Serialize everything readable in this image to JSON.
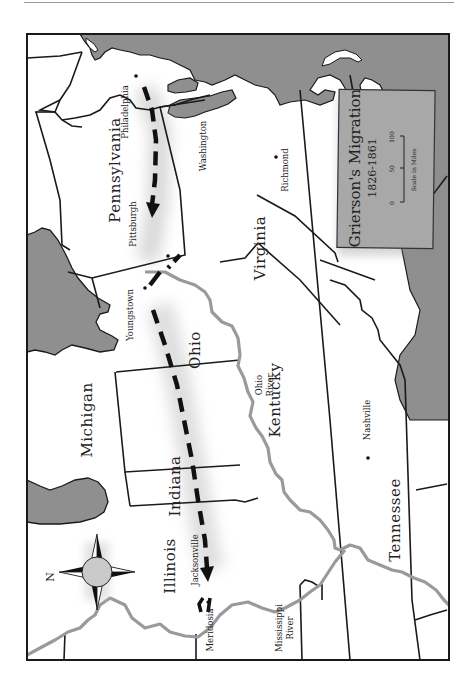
{
  "map": {
    "title": "Grierson's Migration",
    "subtitle": "1826-1861",
    "orientation": "rotated 90 degrees, north points left",
    "compass": {
      "label": "N",
      "icon": "compass-rose-icon"
    },
    "scale": {
      "ticks": [
        "0",
        "50",
        "100"
      ],
      "label": "Scale in Miles"
    },
    "states": [
      {
        "id": "pennsylvania",
        "label": "Pennsylvania"
      },
      {
        "id": "virginia",
        "label": "Virginia"
      },
      {
        "id": "ohio",
        "label": "Ohio"
      },
      {
        "id": "kentucky",
        "label": "Kentucky"
      },
      {
        "id": "indiana",
        "label": "Indiana"
      },
      {
        "id": "michigan",
        "label": "Michigan"
      },
      {
        "id": "illinois",
        "label": "Illinois"
      },
      {
        "id": "tennessee",
        "label": "Tennessee"
      }
    ],
    "cities": [
      {
        "id": "philadelphia",
        "label": "Philadelphia"
      },
      {
        "id": "pittsburgh",
        "label": "Pittsburgh"
      },
      {
        "id": "washington",
        "label": "Washington"
      },
      {
        "id": "richmond",
        "label": "Richmond"
      },
      {
        "id": "youngstown",
        "label": "Youngstown"
      },
      {
        "id": "nashville",
        "label": "Nashville"
      },
      {
        "id": "jacksonville",
        "label": "Jacksonville"
      },
      {
        "id": "meridosia",
        "label": "Meridosia"
      }
    ],
    "rivers": [
      {
        "id": "ohio-river",
        "line1": "Ohio",
        "line2": "River"
      },
      {
        "id": "mississippi-river",
        "line1": "Mississippi",
        "line2": "River"
      }
    ],
    "route": {
      "from": "Philadelphia",
      "via": [
        "Pittsburgh",
        "Youngstown"
      ],
      "to": "Meridosia"
    },
    "colors": {
      "water": "#8f8f8f",
      "land": "#ffffff",
      "border": "#1a1a1a",
      "river": "#9a9a9a",
      "legend_box": "#a8a8a8",
      "route": "#111111"
    }
  }
}
